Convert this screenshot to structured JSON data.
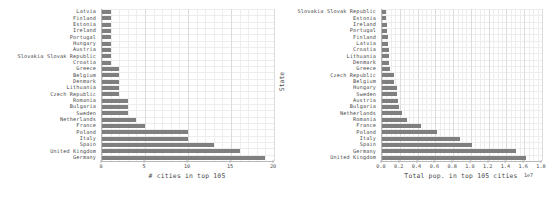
{
  "figure": {
    "title": "",
    "caption": ""
  },
  "chart_data": [
    {
      "id": "cities-count",
      "type": "bar",
      "orientation": "horizontal",
      "title": "",
      "xlabel": "# cities in top 105",
      "ylabel": "State",
      "xlim": [
        0,
        20
      ],
      "xticks": [
        0,
        5,
        10,
        15,
        20
      ],
      "xticklabels": [
        "0",
        "5",
        "10",
        "15",
        "20"
      ],
      "grid": true,
      "legend": "none",
      "bar_color": "#7f7f7f",
      "categories": [
        "Latvia",
        "Finland",
        "Estonia",
        "Ireland",
        "Portugal",
        "Hungary",
        "Austria",
        "Slovakia Slovak Republic",
        "Croatia",
        "Greece",
        "Belgium",
        "Denmark",
        "Lithuania",
        "Czech Republic",
        "Romania",
        "Bulgaria",
        "Sweden",
        "Netherlands",
        "France",
        "Poland",
        "Italy",
        "Spain",
        "United Kingdom",
        "Germany"
      ],
      "values": [
        1,
        1,
        1,
        1,
        1,
        1,
        1,
        1,
        1,
        2,
        2,
        2,
        2,
        2,
        3,
        3,
        3,
        4,
        5,
        10,
        10,
        13,
        16,
        19
      ]
    },
    {
      "id": "cities-population",
      "type": "bar",
      "orientation": "horizontal",
      "title": "",
      "xlabel": "Total pop. in top 105 cities",
      "ylabel": "State",
      "xlim": [
        0,
        18000000
      ],
      "x_offset_text": "1e7",
      "xticks": [
        0,
        2000000,
        4000000,
        6000000,
        8000000,
        10000000,
        12000000,
        14000000,
        16000000,
        18000000
      ],
      "xticklabels": [
        "0.0",
        "0.2",
        "0.4",
        "0.6",
        "0.8",
        "1.0",
        "1.2",
        "1.4",
        "1.6",
        "1.8"
      ],
      "grid": true,
      "legend": "none",
      "bar_color": "#7f7f7f",
      "categories": [
        "Slovakia Slovak Republic",
        "Estonia",
        "Ireland",
        "Portugal",
        "Finland",
        "Latvia",
        "Croatia",
        "Lithuania",
        "Denmark",
        "Greece",
        "Czech Republic",
        "Belgium",
        "Hungary",
        "Sweden",
        "Austria",
        "Bulgaria",
        "Netherlands",
        "Romania",
        "France",
        "Poland",
        "Italy",
        "Spain",
        "Germany",
        "United Kingdom"
      ],
      "values": [
        430000,
        440000,
        550000,
        560000,
        640000,
        700000,
        800000,
        820000,
        840000,
        900000,
        1300000,
        1350000,
        1700000,
        1700000,
        1800000,
        1900000,
        2200000,
        2800000,
        4400000,
        6200000,
        8800000,
        10100000,
        15100000,
        16200000
      ]
    }
  ]
}
